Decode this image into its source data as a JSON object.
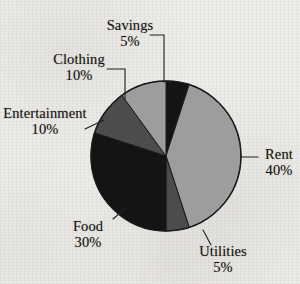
{
  "chart_data": {
    "type": "pie",
    "title": "",
    "subtitle": "",
    "xlabel": "",
    "ylabel": "",
    "legend_position": "none",
    "grid": false,
    "units": "%",
    "start_angle_deg": 0,
    "direction": "clockwise",
    "categories": [
      "Savings",
      "Rent",
      "Utilities",
      "Food",
      "Entertainment",
      "Clothing"
    ],
    "values": [
      5,
      40,
      5,
      30,
      10,
      10
    ],
    "labels": [
      "Savings 5%",
      "Rent 40%",
      "Utilities 5%",
      "Food 30%",
      "Entertainment 10%",
      "Clothing 10%"
    ],
    "colors": [
      "#141414",
      "#9d9d9d",
      "#4c4c4c",
      "#141414",
      "#4c4c4c",
      "#9d9d9d"
    ],
    "slices": [
      {
        "name": "Savings",
        "value": 5,
        "value_label": "5%",
        "color": "#141414",
        "start_deg": 0,
        "end_deg": 18
      },
      {
        "name": "Rent",
        "value": 40,
        "value_label": "40%",
        "color": "#9d9d9d",
        "start_deg": 18,
        "end_deg": 162
      },
      {
        "name": "Utilities",
        "value": 5,
        "value_label": "5%",
        "color": "#4c4c4c",
        "start_deg": 162,
        "end_deg": 180
      },
      {
        "name": "Food",
        "value": 30,
        "value_label": "30%",
        "color": "#141414",
        "start_deg": 180,
        "end_deg": 288
      },
      {
        "name": "Entertainment",
        "value": 10,
        "value_label": "10%",
        "color": "#4c4c4c",
        "start_deg": 288,
        "end_deg": 324
      },
      {
        "name": "Clothing",
        "value": 10,
        "value_label": "10%",
        "color": "#9d9d9d",
        "start_deg": 324,
        "end_deg": 360
      }
    ]
  },
  "labels": {
    "savings": {
      "name": "Savings",
      "value": "5%"
    },
    "clothing": {
      "name": "Clothing",
      "value": "10%"
    },
    "entertainment": {
      "name": "Entertainment",
      "value": "10%"
    },
    "rent": {
      "name": "Rent",
      "value": "40%"
    },
    "food": {
      "name": "Food",
      "value": "30%"
    },
    "utilities": {
      "name": "Utilities",
      "value": "5%"
    }
  },
  "style": {
    "background": "#eeedea",
    "outline": "#1a1a1a",
    "text": "#15130f",
    "light_gray": "#9d9d9d",
    "dark_gray": "#4c4c4c",
    "black": "#141414"
  }
}
